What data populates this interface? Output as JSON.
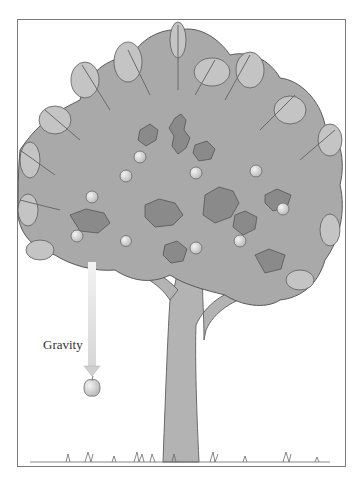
{
  "illustration": {
    "subject": "apple tree with falling apple",
    "label": "Gravity",
    "colors": {
      "canopy": "#a9a9a9",
      "canopy_dark": "#8a8a8a",
      "leaf_outline": "#5a5a5a",
      "trunk": "#b3b3b3",
      "trunk_outline": "#6a6a6a",
      "apple": "#d9d9d9",
      "arrow": "#e6e6e6",
      "frame": "#7a7a7a"
    },
    "apples_in_tree": 10,
    "falling_apple_count": 1
  }
}
